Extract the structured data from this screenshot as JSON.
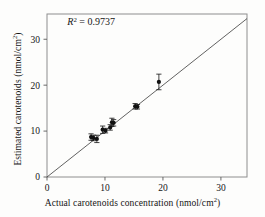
{
  "figure": {
    "type": "scatter-regression-plot",
    "background_color": "#fdfdfc",
    "foreground_color": "#1a1a1a"
  },
  "axes": {
    "x_title_main": "Actual carotenoids concentration (nmol/cm",
    "x_title_sup": "2",
    "x_title_tail": ")",
    "y_title_main": "Estimated carotenoids (nmol/cm",
    "y_title_sup": "2",
    "y_title_tail": ")",
    "x_ticks": [
      "0",
      "10",
      "20",
      "30"
    ],
    "y_ticks": [
      "0",
      "10",
      "20",
      "30"
    ]
  },
  "annotation": {
    "r_symbol": "R",
    "r_exponent": "2",
    "r_value": " = 0.9737",
    "full_text": "R2 = 0.9737"
  },
  "chart_data": {
    "type": "scatter",
    "title": "",
    "xlabel": "Actual carotenoids concentration (nmol/cm2)",
    "ylabel": "Estimated carotenoids (nmol/cm2)",
    "xlim": [
      0,
      34.5
    ],
    "ylim": [
      0,
      35.5
    ],
    "xticks": [
      0,
      10,
      20,
      30
    ],
    "yticks": [
      0,
      10,
      20,
      30
    ],
    "grid": false,
    "legend": null,
    "annotations": [
      {
        "text": "R2 = 0.9737",
        "x": 3.5,
        "y": 33.0
      }
    ],
    "reference_line": {
      "name": "1:1 identity line",
      "x": [
        0,
        34.5
      ],
      "y": [
        0,
        34.5
      ],
      "style": "solid",
      "color": "#3a3a3a",
      "width": 0.8
    },
    "series": [
      {
        "name": "Estimated vs actual carotenoids",
        "marker": "filled-circle",
        "color": "#111111",
        "error_bars": "vertical-with-caps",
        "points": [
          {
            "x": 7.6,
            "y": 8.7,
            "yerr": 0.7
          },
          {
            "x": 8.0,
            "y": 8.5,
            "yerr": 0.6
          },
          {
            "x": 8.6,
            "y": 8.3,
            "yerr": 0.8
          },
          {
            "x": 9.6,
            "y": 10.3,
            "yerr": 0.8
          },
          {
            "x": 10.1,
            "y": 10.1,
            "yerr": 0.5
          },
          {
            "x": 10.9,
            "y": 10.8,
            "yerr": 0.6
          },
          {
            "x": 11.2,
            "y": 11.9,
            "yerr": 0.9
          },
          {
            "x": 11.5,
            "y": 11.8,
            "yerr": 0.7
          },
          {
            "x": 15.2,
            "y": 15.4,
            "yerr": 0.6
          },
          {
            "x": 15.6,
            "y": 15.3,
            "yerr": 0.5
          },
          {
            "x": 19.3,
            "y": 20.7,
            "yerr": 1.7
          }
        ]
      }
    ]
  }
}
